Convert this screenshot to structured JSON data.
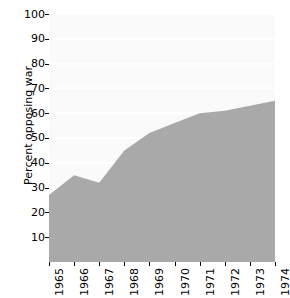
{
  "chart_data": {
    "type": "area",
    "title": "",
    "xlabel": "",
    "ylabel": "Percent opposing war",
    "categories": [
      "1965",
      "1966",
      "1967",
      "1968",
      "1969",
      "1970",
      "1971",
      "1972",
      "1973",
      "1974"
    ],
    "x": [
      1965,
      1966,
      1967,
      1968,
      1969,
      1970,
      1971,
      1972,
      1973,
      1974
    ],
    "values": [
      27,
      35,
      32,
      45,
      52,
      56,
      60,
      61,
      63,
      65
    ],
    "series": [
      {
        "name": "Percent opposing war",
        "values": [
          27,
          35,
          32,
          45,
          52,
          56,
          60,
          61,
          63,
          65
        ]
      }
    ],
    "ylim": [
      0,
      100
    ],
    "xlim": [
      1965,
      1974
    ],
    "yticks": [
      10,
      20,
      30,
      40,
      50,
      60,
      70,
      80,
      90,
      100
    ],
    "ytick_labels": [
      "10",
      "20",
      "30",
      "40",
      "50",
      "60",
      "70",
      "80",
      "90",
      "100"
    ],
    "xtick_labels": [
      "1965",
      "1966",
      "1967",
      "1968",
      "1969",
      "1970",
      "1971",
      "1972",
      "1973",
      "1974"
    ],
    "grid": true,
    "grid_axis": "y",
    "legend": false,
    "legend_position": "none",
    "colors": {
      "area_fill": "#a9a9a9",
      "plot_background": "#fafafa",
      "gridline": "#ffffff",
      "axis_text": "#000000",
      "page_background": "#ffffff"
    }
  }
}
